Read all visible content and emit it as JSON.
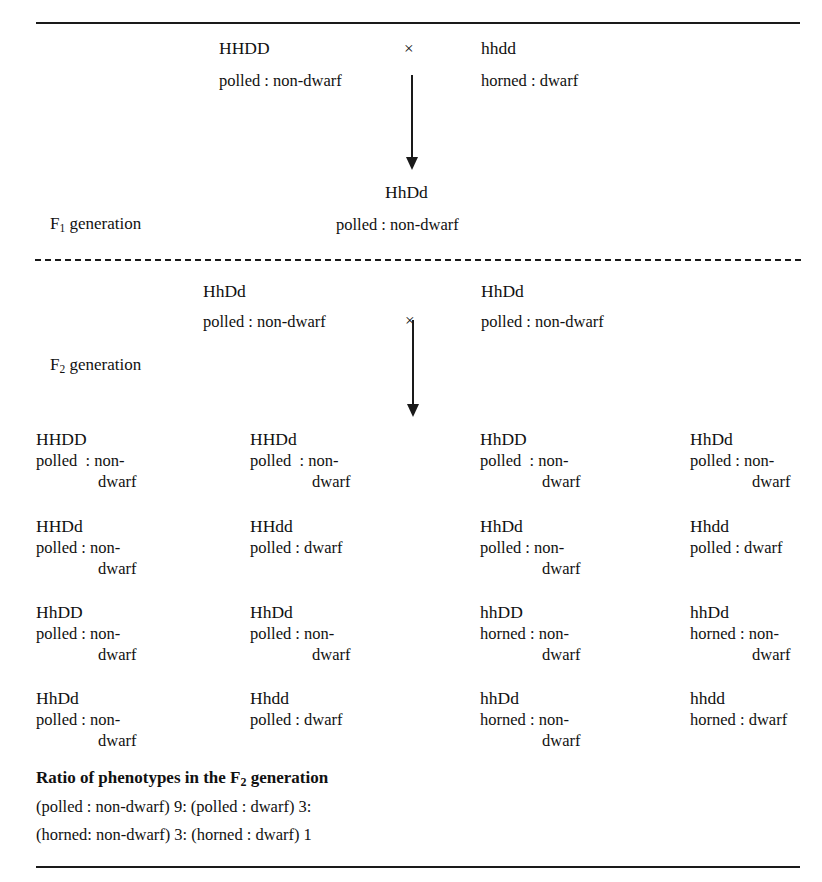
{
  "rules": {
    "top": "horizontal-rule",
    "middle": "dashed-divider",
    "bottom": "horizontal-rule"
  },
  "parental": {
    "left_genotype": "HHDD",
    "left_phenotype": "polled : non-dwarf",
    "cross_symbol": "×",
    "right_genotype": "hhdd",
    "right_phenotype": "horned : dwarf"
  },
  "f1": {
    "label": "F",
    "label_sub": "1",
    "label_suffix": " generation",
    "genotype": "HhDd",
    "phenotype": "polled : non-dwarf"
  },
  "f2_cross": {
    "left_genotype": "HhDd",
    "left_phenotype": "polled : non-dwarf",
    "cross_symbol": "×",
    "right_genotype": "HhDd",
    "right_phenotype": "polled : non-dwarf"
  },
  "f2": {
    "label": "F",
    "label_sub": "2",
    "label_suffix": " generation"
  },
  "offspring": [
    {
      "genotype": "HHDD",
      "pheno_line1": "polled  : non-",
      "pheno_line2": "dwarf"
    },
    {
      "genotype": "HHDd",
      "pheno_line1": "polled  : non-",
      "pheno_line2": "dwarf"
    },
    {
      "genotype": "HhDD",
      "pheno_line1": "polled  : non-",
      "pheno_line2": "dwarf"
    },
    {
      "genotype": "HhDd",
      "pheno_line1": "polled : non-",
      "pheno_line2": "dwarf"
    },
    {
      "genotype": "HHDd",
      "pheno_line1": "polled : non-",
      "pheno_line2": "dwarf"
    },
    {
      "genotype": "HHdd",
      "pheno_line1": "polled : dwarf",
      "pheno_line2": ""
    },
    {
      "genotype": "HhDd",
      "pheno_line1": "polled : non-",
      "pheno_line2": "dwarf"
    },
    {
      "genotype": "Hhdd",
      "pheno_line1": "polled : dwarf",
      "pheno_line2": ""
    },
    {
      "genotype": "HhDD",
      "pheno_line1": "polled : non-",
      "pheno_line2": "dwarf"
    },
    {
      "genotype": "HhDd",
      "pheno_line1": "polled : non-",
      "pheno_line2": "dwarf"
    },
    {
      "genotype": "hhDD",
      "pheno_line1": "horned : non-",
      "pheno_line2": "dwarf"
    },
    {
      "genotype": "hhDd",
      "pheno_line1": "horned : non-",
      "pheno_line2": "dwarf"
    },
    {
      "genotype": "HhDd",
      "pheno_line1": "polled : non-",
      "pheno_line2": "dwarf"
    },
    {
      "genotype": "Hhdd",
      "pheno_line1": "polled : dwarf",
      "pheno_line2": ""
    },
    {
      "genotype": "hhDd",
      "pheno_line1": "horned : non-",
      "pheno_line2": "dwarf"
    },
    {
      "genotype": "hhdd",
      "pheno_line1": "horned : dwarf",
      "pheno_line2": ""
    }
  ],
  "ratio": {
    "title_prefix": "Ratio of phenotypes in the F",
    "title_sub": "2",
    "title_suffix": " generation",
    "line1": "(polled : non-dwarf) 9: (polled : dwarf) 3:",
    "line2": "(horned: non-dwarf) 3: (horned : dwarf) 1"
  }
}
